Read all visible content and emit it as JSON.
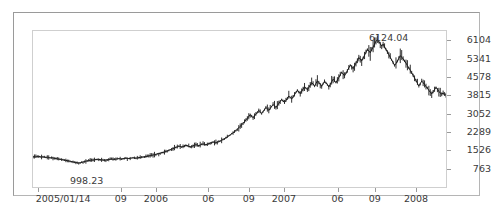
{
  "chart_data": {
    "type": "line",
    "title": "",
    "xlabel": "",
    "ylabel": "",
    "ylim": [
      0,
      6485
    ],
    "grid": false,
    "legend": "none",
    "line_color": "#1a1a1a",
    "background": "#ffffff",
    "y_ticks": [
      {
        "label": "6104",
        "value": 6104
      },
      {
        "label": "5341",
        "value": 5341
      },
      {
        "label": "4578",
        "value": 4578
      },
      {
        "label": "3815",
        "value": 3815
      },
      {
        "label": "3052",
        "value": 3052
      },
      {
        "label": "2289",
        "value": 2289
      },
      {
        "label": "1526",
        "value": 1526
      },
      {
        "label": "763",
        "value": 763
      }
    ],
    "x_ticks": [
      {
        "label": "2005/01/14",
        "pos": 0.014
      },
      {
        "label": "09",
        "pos": 0.215
      },
      {
        "label": "2006",
        "pos": 0.3
      },
      {
        "label": "06",
        "pos": 0.427
      },
      {
        "label": "09",
        "pos": 0.525
      },
      {
        "label": "2007",
        "pos": 0.61
      },
      {
        "label": "06",
        "pos": 0.74
      },
      {
        "label": "09",
        "pos": 0.83
      },
      {
        "label": "2008",
        "pos": 0.93
      }
    ],
    "annotations": [
      {
        "name": "high",
        "text": "6124.04",
        "value": 6124.04,
        "pos": 0.845
      },
      {
        "name": "low",
        "text": "998.23",
        "value": 998.23,
        "pos": 0.1
      }
    ],
    "x_start": "2005/01/14",
    "x_end": "2008",
    "values": [
      1250,
      1262,
      1248,
      1268,
      1275,
      1258,
      1244,
      1252,
      1236,
      1228,
      1240,
      1222,
      1210,
      1218,
      1205,
      1195,
      1182,
      1172,
      1160,
      1150,
      1138,
      1128,
      1115,
      1106,
      1095,
      1082,
      1070,
      1058,
      1042,
      1030,
      1018,
      1006,
      998,
      1005,
      1020,
      1038,
      1056,
      1072,
      1088,
      1100,
      1112,
      1124,
      1118,
      1130,
      1142,
      1152,
      1146,
      1136,
      1128,
      1118,
      1110,
      1120,
      1132,
      1145,
      1152,
      1160,
      1156,
      1148,
      1158,
      1170,
      1178,
      1172,
      1165,
      1175,
      1186,
      1196,
      1190,
      1182,
      1192,
      1204,
      1212,
      1206,
      1198,
      1208,
      1220,
      1232,
      1240,
      1248,
      1256,
      1268,
      1278,
      1290,
      1302,
      1316,
      1330,
      1344,
      1356,
      1372,
      1388,
      1404,
      1420,
      1438,
      1456,
      1478,
      1500,
      1525,
      1548,
      1572,
      1595,
      1620,
      1648,
      1672,
      1700,
      1688,
      1665,
      1680,
      1705,
      1730,
      1712,
      1690,
      1672,
      1688,
      1710,
      1735,
      1758,
      1740,
      1722,
      1745,
      1768,
      1790,
      1772,
      1755,
      1778,
      1800,
      1825,
      1848,
      1870,
      1852,
      1835,
      1858,
      1885,
      1910,
      1940,
      1975,
      2010,
      2048,
      2085,
      2125,
      2168,
      2210,
      2255,
      2300,
      2350,
      2405,
      2460,
      2520,
      2585,
      2650,
      2720,
      2790,
      2860,
      2930,
      3005,
      2940,
      2880,
      2950,
      3030,
      3110,
      3185,
      3120,
      3060,
      3140,
      3225,
      3310,
      3250,
      3185,
      3265,
      3350,
      3430,
      3370,
      3305,
      3390,
      3475,
      3560,
      3640,
      3575,
      3510,
      3600,
      3690,
      3780,
      3720,
      3655,
      3745,
      3840,
      3930,
      4020,
      3955,
      3880,
      3975,
      4075,
      4170,
      4110,
      4040,
      4140,
      4240,
      4340,
      4280,
      4200,
      4305,
      4410,
      4350,
      4270,
      4185,
      4290,
      4395,
      4340,
      4255,
      4160,
      4265,
      4375,
      4480,
      4420,
      4340,
      4445,
      4550,
      4660,
      4765,
      4700,
      4620,
      4730,
      4840,
      4950,
      5060,
      5000,
      4920,
      5035,
      5150,
      5265,
      5380,
      5320,
      5240,
      5360,
      5480,
      5600,
      5720,
      5660,
      5580,
      5700,
      5820,
      5940,
      6060,
      6124,
      6040,
      5950,
      5860,
      5940,
      5830,
      5720,
      5610,
      5500,
      5390,
      5280,
      5170,
      5060,
      5130,
      5240,
      5350,
      5460,
      5400,
      5320,
      5240,
      5150,
      5050,
      4950,
      4850,
      4750,
      4640,
      4530,
      4420,
      4310,
      4200,
      4300,
      4400,
      4340,
      4260,
      4180,
      4100,
      4020,
      3940,
      3870,
      3960,
      4050,
      4140,
      4060,
      3980,
      3900,
      3870,
      3905,
      3850,
      3815
    ]
  }
}
